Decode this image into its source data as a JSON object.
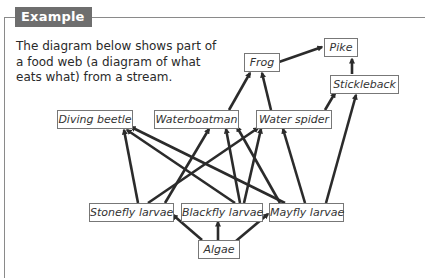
{
  "header": {
    "tag_label": "Example"
  },
  "intro": {
    "text": "The diagram below shows part of a food web (a diagram of what eats what) from a stream."
  },
  "food_web": {
    "nodes": {
      "pike": "Pike",
      "frog": "Frog",
      "stickleback": "Stickleback",
      "diving_beetle": "Diving beetle",
      "waterboatman": "Waterboatman",
      "water_spider": "Water spider",
      "stonefly_larvae": "Stonefly larvae",
      "blackfly_larvae": "Blackfly larvae",
      "mayfly_larvae": "Mayfly larvae",
      "algae": "Algae"
    },
    "edges": [
      {
        "from": "Frog",
        "to": "Pike"
      },
      {
        "from": "Stickleback",
        "to": "Pike"
      },
      {
        "from": "Waterboatman",
        "to": "Frog"
      },
      {
        "from": "Water spider",
        "to": "Frog"
      },
      {
        "from": "Water spider",
        "to": "Stickleback"
      },
      {
        "from": "Mayfly larvae",
        "to": "Stickleback"
      },
      {
        "from": "Stonefly larvae",
        "to": "Diving beetle"
      },
      {
        "from": "Blackfly larvae",
        "to": "Diving beetle"
      },
      {
        "from": "Mayfly larvae",
        "to": "Diving beetle"
      },
      {
        "from": "Stonefly larvae",
        "to": "Waterboatman"
      },
      {
        "from": "Blackfly larvae",
        "to": "Waterboatman"
      },
      {
        "from": "Mayfly larvae",
        "to": "Waterboatman"
      },
      {
        "from": "Stonefly larvae",
        "to": "Water spider"
      },
      {
        "from": "Blackfly larvae",
        "to": "Water spider"
      },
      {
        "from": "Mayfly larvae",
        "to": "Water spider"
      },
      {
        "from": "Algae",
        "to": "Stonefly larvae"
      },
      {
        "from": "Algae",
        "to": "Blackfly larvae"
      },
      {
        "from": "Algae",
        "to": "Mayfly larvae"
      }
    ],
    "colors": {
      "arrow": "#2b2b2b",
      "box_border": "#777777",
      "tag_bg": "#6e6e6e"
    }
  }
}
